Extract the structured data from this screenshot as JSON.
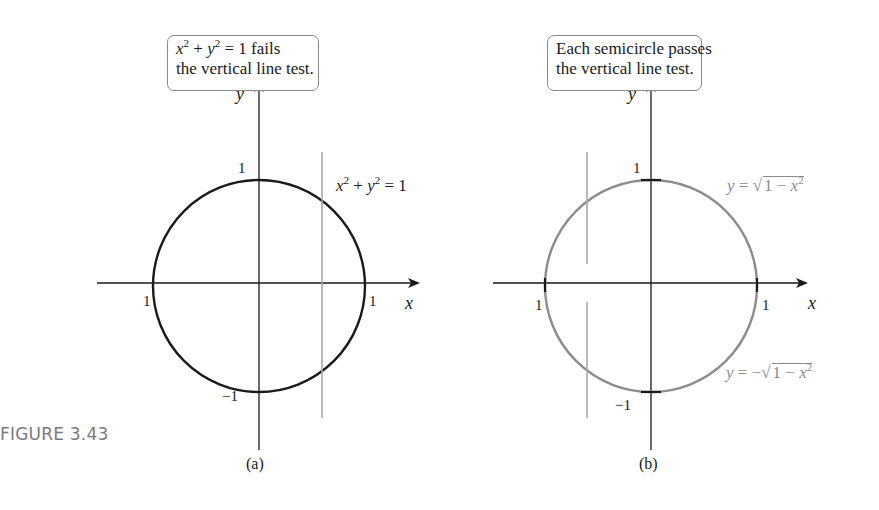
{
  "figure": {
    "label": "FIGURE 3.43"
  },
  "panel_a": {
    "sublabel": "(a)",
    "callout": {
      "line1_eq": {
        "x": "x",
        "exp1": "2",
        "plus": " + ",
        "y": "y",
        "exp2": "2",
        "eq": " = 1",
        "rest": " fails"
      },
      "line2": "the vertical line test."
    },
    "curve_label": {
      "x": "x",
      "exp1": "2",
      "plus": " + ",
      "y": "y",
      "exp2": "2",
      "eq": " = 1"
    },
    "axes": {
      "x_name": "x",
      "y_name": "y"
    },
    "ticks": {
      "x_left": "1",
      "x_right": "1",
      "y_top": "1",
      "y_bottom": "−1"
    },
    "colors": {
      "curve": "#1a1a1a",
      "test_line": "#a8a8a8",
      "axis": "#1a1a1a"
    }
  },
  "panel_b": {
    "sublabel": "(b)",
    "callout": {
      "line1": "Each semicircle passes",
      "line2": "the vertical line test."
    },
    "upper_label": {
      "y": "y",
      "eq": " = ",
      "radicand": "1 − ",
      "x": "x",
      "exp": "2",
      "sqrt": "√"
    },
    "lower_label": {
      "y": "y",
      "eq": " = −",
      "radicand": "1 − ",
      "x": "x",
      "exp": "2",
      "sqrt": "√"
    },
    "axes": {
      "x_name": "x",
      "y_name": "y"
    },
    "ticks": {
      "x_left": "1",
      "x_right": "1",
      "y_top": "1",
      "y_bottom": "−1"
    },
    "colors": {
      "curve": "#8c8c8c",
      "test_line": "#a8a8a8",
      "axis": "#1a1a1a"
    }
  }
}
